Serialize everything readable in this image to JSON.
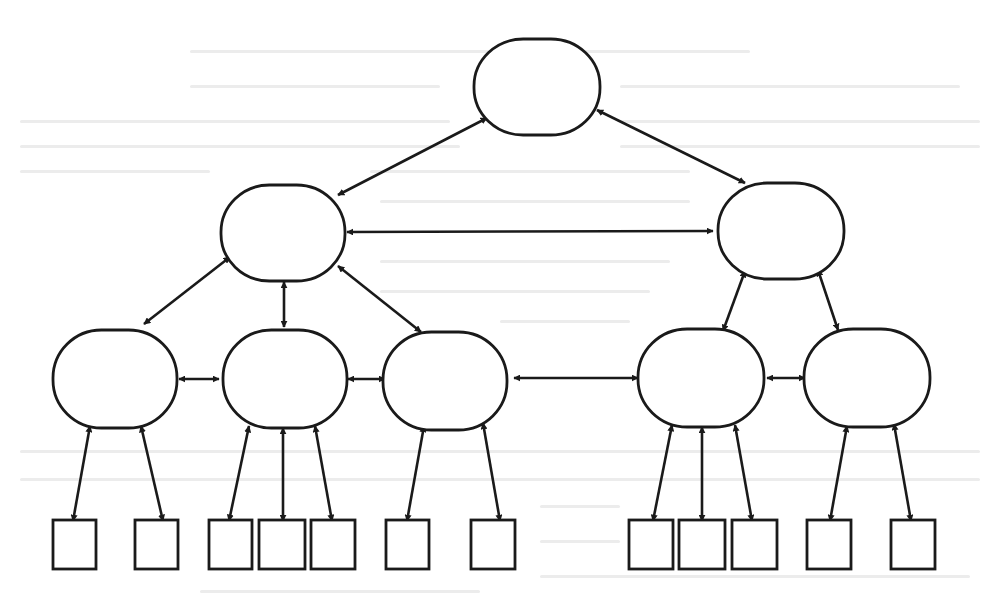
{
  "diagram": {
    "title": "",
    "stroke_color": "#1a1a1a",
    "background_color": "#ffffff",
    "bleed_color": "#ececec",
    "nodes": [
      {
        "id": "root",
        "shape": "ellipse",
        "level": 0,
        "cx": 537,
        "cy": 87,
        "rx": 63,
        "ry": 48
      },
      {
        "id": "m1",
        "shape": "ellipse",
        "level": 1,
        "cx": 283,
        "cy": 233,
        "rx": 62,
        "ry": 48
      },
      {
        "id": "m2",
        "shape": "ellipse",
        "level": 1,
        "cx": 781,
        "cy": 231,
        "rx": 63,
        "ry": 48
      },
      {
        "id": "l1",
        "shape": "ellipse",
        "level": 2,
        "cx": 115,
        "cy": 379,
        "rx": 62,
        "ry": 49
      },
      {
        "id": "l2",
        "shape": "ellipse",
        "level": 2,
        "cx": 285,
        "cy": 379,
        "rx": 62,
        "ry": 49
      },
      {
        "id": "l3",
        "shape": "ellipse",
        "level": 2,
        "cx": 445,
        "cy": 381,
        "rx": 62,
        "ry": 49
      },
      {
        "id": "l4",
        "shape": "ellipse",
        "level": 2,
        "cx": 701,
        "cy": 378,
        "rx": 63,
        "ry": 49
      },
      {
        "id": "l5",
        "shape": "ellipse",
        "level": 2,
        "cx": 867,
        "cy": 378,
        "rx": 63,
        "ry": 49
      },
      {
        "id": "b1",
        "shape": "rect",
        "level": 3,
        "x": 53,
        "y": 520,
        "w": 43,
        "h": 49
      },
      {
        "id": "b2",
        "shape": "rect",
        "level": 3,
        "x": 135,
        "y": 520,
        "w": 43,
        "h": 49
      },
      {
        "id": "b3",
        "shape": "rect",
        "level": 3,
        "x": 209,
        "y": 520,
        "w": 43,
        "h": 49
      },
      {
        "id": "b4",
        "shape": "rect",
        "level": 3,
        "x": 259,
        "y": 520,
        "w": 46,
        "h": 49
      },
      {
        "id": "b5",
        "shape": "rect",
        "level": 3,
        "x": 311,
        "y": 520,
        "w": 44,
        "h": 49
      },
      {
        "id": "b6",
        "shape": "rect",
        "level": 3,
        "x": 386,
        "y": 520,
        "w": 43,
        "h": 49
      },
      {
        "id": "b7",
        "shape": "rect",
        "level": 3,
        "x": 471,
        "y": 520,
        "w": 44,
        "h": 49
      },
      {
        "id": "b8",
        "shape": "rect",
        "level": 3,
        "x": 629,
        "y": 520,
        "w": 44,
        "h": 49
      },
      {
        "id": "b9",
        "shape": "rect",
        "level": 3,
        "x": 679,
        "y": 520,
        "w": 46,
        "h": 49
      },
      {
        "id": "b10",
        "shape": "rect",
        "level": 3,
        "x": 732,
        "y": 520,
        "w": 45,
        "h": 49
      },
      {
        "id": "b11",
        "shape": "rect",
        "level": 3,
        "x": 807,
        "y": 520,
        "w": 44,
        "h": 49
      },
      {
        "id": "b12",
        "shape": "rect",
        "level": 3,
        "x": 891,
        "y": 520,
        "w": 44,
        "h": 49
      }
    ],
    "edges": [
      {
        "from": "root",
        "to": "m1",
        "x1": 487,
        "y1": 118,
        "x2": 338,
        "y2": 195,
        "head_start": true,
        "head_end": true
      },
      {
        "from": "root",
        "to": "m2",
        "x1": 597,
        "y1": 110,
        "x2": 745,
        "y2": 183,
        "head_start": true,
        "head_end": true
      },
      {
        "from": "m1",
        "to": "m2",
        "x1": 347,
        "y1": 232,
        "x2": 713,
        "y2": 231,
        "head_start": true,
        "head_end": true
      },
      {
        "from": "m1",
        "to": "l1",
        "x1": 230,
        "y1": 257,
        "x2": 144,
        "y2": 324,
        "head_start": true,
        "head_end": true
      },
      {
        "from": "m1",
        "to": "l2",
        "x1": 284,
        "y1": 282,
        "x2": 284,
        "y2": 327,
        "head_start": true,
        "head_end": true
      },
      {
        "from": "m1",
        "to": "l3",
        "x1": 338,
        "y1": 266,
        "x2": 421,
        "y2": 332,
        "head_start": true,
        "head_end": true
      },
      {
        "from": "m2",
        "to": "l4",
        "x1": 745,
        "y1": 271,
        "x2": 723,
        "y2": 331,
        "head_start": true,
        "head_end": true
      },
      {
        "from": "m2",
        "to": "l5",
        "x1": 818,
        "y1": 270,
        "x2": 838,
        "y2": 330,
        "head_start": true,
        "head_end": true
      },
      {
        "from": "l1",
        "to": "l2",
        "x1": 179,
        "y1": 379,
        "x2": 219,
        "y2": 379,
        "head_start": true,
        "head_end": true
      },
      {
        "from": "l2",
        "to": "l3",
        "x1": 348,
        "y1": 379,
        "x2": 385,
        "y2": 379,
        "head_start": true,
        "head_end": true
      },
      {
        "from": "l3",
        "to": "l4",
        "x1": 514,
        "y1": 378,
        "x2": 638,
        "y2": 378,
        "head_start": true,
        "head_end": true
      },
      {
        "from": "l4",
        "to": "l5",
        "x1": 767,
        "y1": 378,
        "x2": 805,
        "y2": 378,
        "head_start": true,
        "head_end": true
      },
      {
        "from": "l1",
        "to": "b1",
        "x1": 90,
        "y1": 426,
        "x2": 73,
        "y2": 521,
        "head_start": true,
        "head_end": true
      },
      {
        "from": "l1",
        "to": "b2",
        "x1": 141,
        "y1": 426,
        "x2": 163,
        "y2": 521,
        "head_start": true,
        "head_end": true
      },
      {
        "from": "l2",
        "to": "b3",
        "x1": 249,
        "y1": 426,
        "x2": 229,
        "y2": 521,
        "head_start": true,
        "head_end": true
      },
      {
        "from": "l2",
        "to": "b4",
        "x1": 283,
        "y1": 428,
        "x2": 283,
        "y2": 521,
        "head_start": true,
        "head_end": true
      },
      {
        "from": "l2",
        "to": "b5",
        "x1": 315,
        "y1": 426,
        "x2": 332,
        "y2": 521,
        "head_start": true,
        "head_end": true
      },
      {
        "from": "l3",
        "to": "b6",
        "x1": 424,
        "y1": 426,
        "x2": 407,
        "y2": 521,
        "head_start": true,
        "head_end": true
      },
      {
        "from": "l3",
        "to": "b7",
        "x1": 483,
        "y1": 423,
        "x2": 500,
        "y2": 521,
        "head_start": true,
        "head_end": true
      },
      {
        "from": "l4",
        "to": "b8",
        "x1": 672,
        "y1": 425,
        "x2": 653,
        "y2": 521,
        "head_start": true,
        "head_end": true
      },
      {
        "from": "l4",
        "to": "b9",
        "x1": 702,
        "y1": 427,
        "x2": 702,
        "y2": 521,
        "head_start": true,
        "head_end": true
      },
      {
        "from": "l4",
        "to": "b10",
        "x1": 735,
        "y1": 425,
        "x2": 752,
        "y2": 521,
        "head_start": true,
        "head_end": true
      },
      {
        "from": "l5",
        "to": "b11",
        "x1": 847,
        "y1": 426,
        "x2": 830,
        "y2": 521,
        "head_start": true,
        "head_end": true
      },
      {
        "from": "l5",
        "to": "b12",
        "x1": 894,
        "y1": 424,
        "x2": 911,
        "y2": 521,
        "head_start": true,
        "head_end": true
      }
    ]
  }
}
